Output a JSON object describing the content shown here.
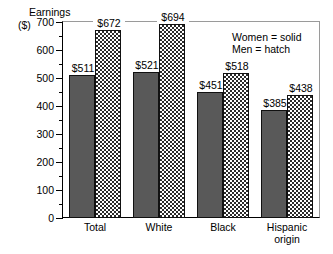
{
  "chart_data": {
    "type": "bar",
    "title": "",
    "ylabel_line1": "Earnings",
    "ylabel_line2": "($)",
    "xlabel": "",
    "ylim": [
      0,
      700
    ],
    "ytick_values": [
      0,
      100,
      200,
      300,
      400,
      500,
      600,
      700
    ],
    "ytick_labels": [
      "0",
      "100",
      "200",
      "300",
      "400",
      "500",
      "600",
      "700"
    ],
    "minor_tick_values": [
      50,
      150,
      250,
      350,
      450,
      550,
      650
    ],
    "grid": false,
    "legend_position": "top-right",
    "categories": [
      "Total",
      "White",
      "Black",
      "Hispanic origin"
    ],
    "category_lines": [
      [
        "Total"
      ],
      [
        "White"
      ],
      [
        "Black"
      ],
      [
        "Hispanic",
        "origin"
      ]
    ],
    "series": [
      {
        "name": "Women",
        "style": "solid",
        "values": [
          511,
          521,
          451,
          385
        ],
        "labels": [
          "$511",
          "$521",
          "$451",
          "$385"
        ]
      },
      {
        "name": "Men",
        "style": "hatch",
        "values": [
          672,
          694,
          518,
          438
        ],
        "labels": [
          "$672",
          "$694",
          "$518",
          "$438"
        ]
      }
    ]
  },
  "legend": {
    "entries": [
      {
        "text": "Women = solid"
      },
      {
        "text": "Men = hatch"
      }
    ]
  },
  "colors": {
    "solid_fill": "#595959",
    "hatch_fill": "#2b2b2b",
    "axis": "#000000",
    "frame": "#9a9a9a",
    "background": "#ffffff"
  }
}
